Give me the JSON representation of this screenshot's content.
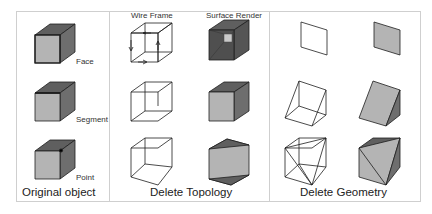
{
  "panels": [
    {
      "title": "Original object",
      "labels": [
        "Face",
        "Segment",
        "Point"
      ]
    },
    {
      "title": "Delete Topology",
      "column_headers": [
        "Wire Frame",
        "Surface Render"
      ]
    },
    {
      "title": "Delete Geometry"
    }
  ],
  "colors": {
    "top_face": "#5f5f5f",
    "front_face": "#b4b4b4",
    "side_face": "#6e6e6e",
    "edge": "#1e1e1e",
    "border": "#cfcfcf"
  }
}
